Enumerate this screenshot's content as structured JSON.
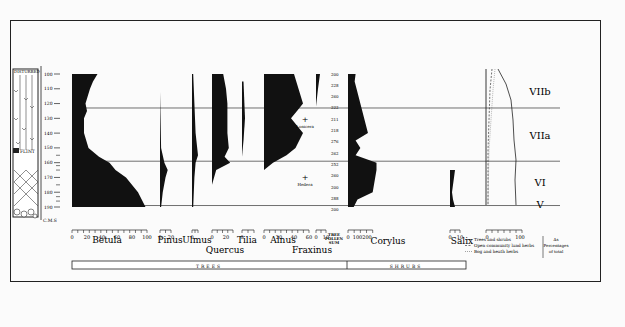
{
  "chart_data": {
    "type": "area",
    "title": "",
    "subtype": "pollen-diagram",
    "depth_axis": {
      "unit_label": "C.M.S",
      "ticks": [
        100,
        110,
        120,
        130,
        140,
        150,
        160,
        170,
        180,
        190
      ]
    },
    "stratigraphy": {
      "top_label": "DISTURBED",
      "marker_label": "FLINT"
    },
    "zones": [
      {
        "label": "VIIb",
        "from": 100,
        "to": 123
      },
      {
        "label": "VIIa",
        "from": 123,
        "to": 159
      },
      {
        "label": "VI",
        "from": 159,
        "to": 187
      },
      {
        "label": "V",
        "from": 187,
        "to": 192
      }
    ],
    "group_bar": [
      {
        "label": "TREES"
      },
      {
        "label": "SHRUBS"
      }
    ],
    "tree_pollen_sum": {
      "label": "TREE POLLEN SUM",
      "values": [
        "200",
        "228",
        "260",
        "222",
        "211",
        "218",
        "276",
        "262",
        "252",
        "260",
        "200",
        "288",
        "200"
      ]
    },
    "taxa": [
      {
        "name": "Betula",
        "group": "TREES",
        "scale_ticks": [
          "0",
          "20",
          "40",
          "60",
          "80",
          "100"
        ],
        "depth": [
          100,
          105,
          110,
          120,
          125,
          130,
          140,
          150,
          156,
          160,
          165,
          170,
          180,
          190
        ],
        "values": [
          34,
          28,
          24,
          18,
          20,
          16,
          16,
          22,
          36,
          50,
          58,
          72,
          88,
          98
        ]
      },
      {
        "name": "Pinus",
        "group": "TREES",
        "scale_ticks": [
          "0",
          "20"
        ],
        "depth": [
          112,
          130,
          150,
          160,
          165,
          170,
          180,
          190
        ],
        "values": [
          0,
          1,
          2,
          8,
          14,
          10,
          5,
          2
        ]
      },
      {
        "name": "Ulmus",
        "group": "TREES",
        "scale_ticks": [
          "0"
        ],
        "depth": [
          100,
          120,
          140,
          155,
          160,
          170,
          190
        ],
        "values": [
          1,
          2,
          3,
          5,
          3,
          2,
          1
        ]
      },
      {
        "name": "Quercus",
        "group": "TREES",
        "scale_ticks": [
          "0",
          "20"
        ],
        "depth": [
          100,
          110,
          120,
          130,
          140,
          150,
          156,
          160,
          165,
          175
        ],
        "values": [
          16,
          20,
          22,
          22,
          22,
          24,
          18,
          26,
          6,
          0
        ]
      },
      {
        "name": "Tilia",
        "group": "TREES",
        "scale_ticks": [
          "0"
        ],
        "depth": [
          105,
          130,
          145,
          156
        ],
        "values": [
          1,
          2,
          1,
          0
        ]
      },
      {
        "name": "Alnus",
        "group": "TREES",
        "scale_ticks": [
          "0",
          "20",
          "40",
          "60"
        ],
        "depth": [
          100,
          110,
          120,
          125,
          130,
          140,
          150,
          155,
          160,
          165
        ],
        "values": [
          40,
          46,
          52,
          44,
          36,
          52,
          42,
          30,
          12,
          0
        ],
        "annotations": [
          "+ Lonicera",
          "+ Hedera"
        ]
      },
      {
        "name": "Fraxinus",
        "group": "TREES",
        "scale_ticks": [
          "0",
          "10"
        ],
        "depth": [
          100,
          110,
          122
        ],
        "values": [
          4,
          2,
          0
        ]
      },
      {
        "name": "Corylus",
        "group": "SHRUBS",
        "scale_ticks": [
          "0",
          "100",
          "200"
        ],
        "depth": [
          100,
          105,
          110,
          120,
          130,
          140,
          145,
          150,
          155,
          160,
          165,
          180,
          185,
          190
        ],
        "values": [
          80,
          70,
          90,
          130,
          170,
          210,
          80,
          130,
          80,
          300,
          300,
          260,
          100,
          60
        ]
      },
      {
        "name": "Salix",
        "group": "SHRUBS",
        "scale_ticks": [
          "0",
          "10"
        ],
        "depth": [
          165,
          170,
          180,
          185,
          190
        ],
        "values": [
          5,
          4,
          2,
          3,
          5
        ]
      }
    ],
    "summary_curves": {
      "scale_ticks": [
        "0",
        "100"
      ],
      "legend": [
        {
          "style": "solid",
          "label": "Trees and shrubs"
        },
        {
          "style": "dashed",
          "label": "Open community land herbs"
        },
        {
          "style": "dotted",
          "label": "Bog and heath herbs"
        }
      ],
      "legend_note": "As Percentages of total"
    }
  }
}
